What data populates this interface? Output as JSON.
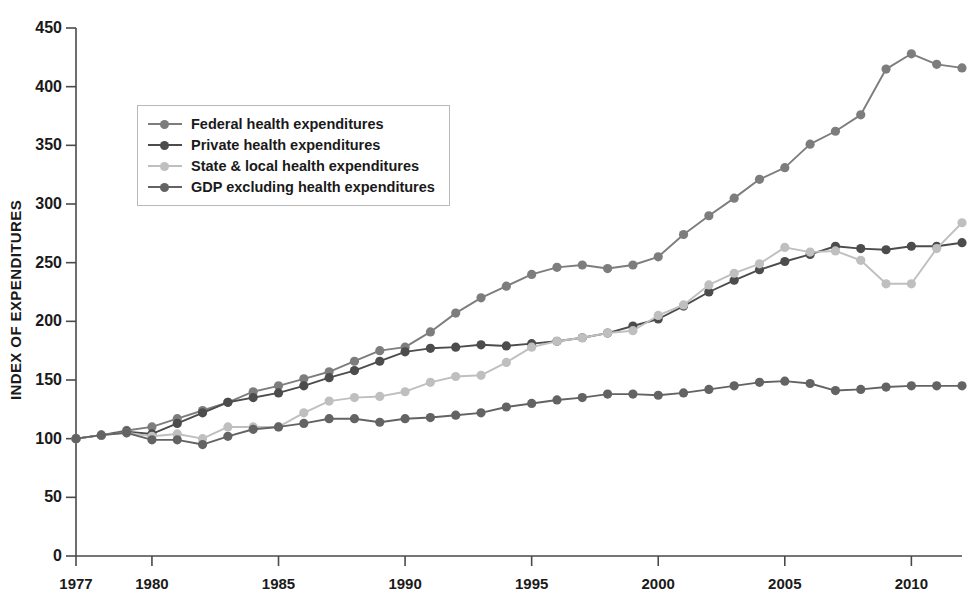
{
  "chart_data": {
    "type": "line",
    "title": "",
    "xlabel": "",
    "ylabel": "INDEX OF EXPENDITURES",
    "xlim": [
      1977,
      2012
    ],
    "ylim": [
      0,
      450
    ],
    "ytick_labels": [
      "0",
      "50",
      "100",
      "150",
      "200",
      "250",
      "300",
      "350",
      "400",
      "450"
    ],
    "yticks": [
      0,
      50,
      100,
      150,
      200,
      250,
      300,
      350,
      400,
      450
    ],
    "xtick_labels": [
      "1977",
      "1980",
      "1985",
      "1990",
      "1995",
      "2000",
      "2005",
      "2010"
    ],
    "xticks": [
      1977,
      1980,
      1985,
      1990,
      1995,
      2000,
      2005,
      2010
    ],
    "grid": false,
    "legend_position": "upper left",
    "x": [
      1977,
      1978,
      1979,
      1980,
      1981,
      1982,
      1983,
      1984,
      1985,
      1986,
      1987,
      1988,
      1989,
      1990,
      1991,
      1992,
      1993,
      1994,
      1995,
      1996,
      1997,
      1998,
      1999,
      2000,
      2001,
      2002,
      2003,
      2004,
      2005,
      2006,
      2007,
      2008,
      2009,
      2010,
      2011,
      2012
    ],
    "series": [
      {
        "name": "Federal health expenditures",
        "color": "#7d7d7d",
        "values": [
          100,
          103,
          107,
          110,
          117,
          124,
          131,
          140,
          145,
          151,
          157,
          166,
          175,
          178,
          191,
          207,
          220,
          230,
          240,
          246,
          248,
          245,
          248,
          255,
          274,
          290,
          305,
          321,
          331,
          351,
          362,
          376,
          415,
          428,
          419,
          416
        ]
      },
      {
        "name": "Private health expenditures",
        "color": "#4c4c4c",
        "values": [
          100,
          103,
          106,
          104,
          113,
          122,
          131,
          135,
          139,
          145,
          152,
          158,
          166,
          174,
          177,
          178,
          180,
          179,
          181,
          183,
          186,
          190,
          196,
          202,
          213,
          225,
          235,
          244,
          251,
          257,
          264,
          262,
          261,
          264,
          264,
          267
        ]
      },
      {
        "name": "State & local health expenditures",
        "color": "#bfbfbf",
        "values": [
          100,
          103,
          105,
          102,
          104,
          100,
          110,
          110,
          110,
          122,
          132,
          135,
          136,
          140,
          148,
          153,
          154,
          165,
          178,
          183,
          186,
          190,
          192,
          205,
          214,
          231,
          241,
          249,
          263,
          259,
          260,
          252,
          232,
          232,
          262,
          284
        ]
      },
      {
        "name": "GDP excluding health expenditures",
        "color": "#636363",
        "values": [
          100,
          103,
          105,
          99,
          99,
          95,
          102,
          108,
          110,
          113,
          117,
          117,
          114,
          117,
          118,
          120,
          122,
          127,
          130,
          133,
          135,
          138,
          138,
          137,
          139,
          142,
          145,
          148,
          149,
          147,
          141,
          142,
          144,
          145,
          145,
          145
        ]
      }
    ]
  },
  "legend": {
    "items": [
      {
        "label": "Federal health expenditures"
      },
      {
        "label": "Private health expenditures"
      },
      {
        "label": "State & local health expenditures"
      },
      {
        "label": "GDP excluding health expenditures"
      }
    ]
  }
}
